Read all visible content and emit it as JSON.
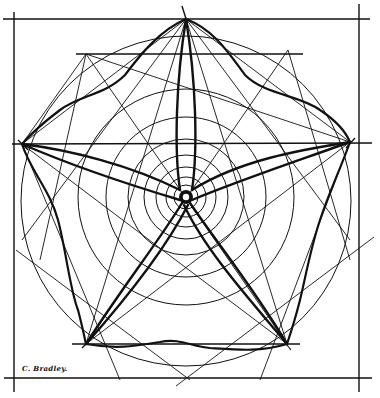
{
  "figure": {
    "title": "",
    "signature": "C. Bradley.",
    "stroke_color": "#111111",
    "background": "#ffffff"
  },
  "geometry": {
    "center": [
      186,
      197
    ],
    "outer_circle_radius": 165,
    "concentric_radii": [
      5,
      12,
      20,
      30,
      42,
      58,
      80,
      108,
      135
    ],
    "star_points": [
      [
        186,
        19
      ],
      [
        350,
        142
      ],
      [
        287,
        344
      ],
      [
        86,
        344
      ],
      [
        22,
        144
      ]
    ],
    "frame": {
      "left_x": 14,
      "right_x": 359,
      "top_y": 19,
      "bottom_y": 378
    }
  }
}
